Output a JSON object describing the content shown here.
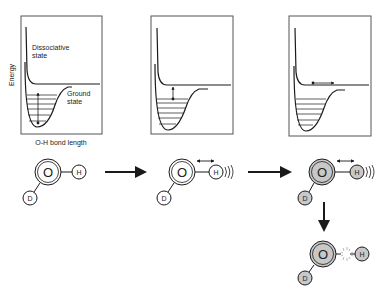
{
  "panels": [
    {
      "id": "panel-1",
      "y_axis_label": "Energy",
      "x_axis_label": "O-H bond length",
      "upper_curve_label_1": "Dissociative",
      "upper_curve_label_2": "state",
      "lower_curve_label_1": "Ground",
      "lower_curve_label_2": "state",
      "annotation": "vertical double arrow within ground-state well"
    },
    {
      "id": "panel-2",
      "annotation": "short vertical arrow from top vibrational level to dissociative state"
    },
    {
      "id": "panel-3",
      "annotation": "horizontal arrow along dissociative state plateau"
    }
  ],
  "molecules": [
    {
      "id": "mol-1",
      "center_atom": "O",
      "atoms": [
        "H",
        "D"
      ],
      "style": "outline",
      "state": "ground"
    },
    {
      "id": "mol-2",
      "center_atom": "O",
      "atoms": [
        "H",
        "D"
      ],
      "style": "outline",
      "state": "vibrating O-H stretch"
    },
    {
      "id": "mol-3",
      "center_atom": "O",
      "atoms": [
        "H",
        "D"
      ],
      "style": "gray-filled",
      "state": "excited, vibrating"
    },
    {
      "id": "mol-4",
      "center_atom": "O",
      "atoms": [
        "H",
        "D"
      ],
      "style": "gray-filled",
      "state": "O-H bond broken"
    }
  ],
  "atom_labels": {
    "oxygen": "O",
    "hydrogen": "H",
    "deuterium": "D"
  },
  "colors": {
    "line": "#1a1a1a",
    "excited_fill": "#c8c8c8",
    "box_border": "#555555"
  }
}
